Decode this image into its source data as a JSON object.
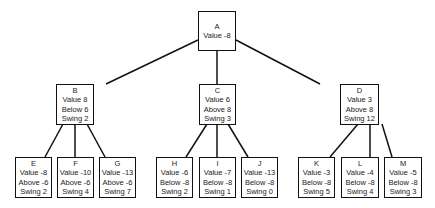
{
  "tree": {
    "root": {
      "id": "A",
      "lines": [
        "A",
        "Value -8"
      ]
    },
    "level1": [
      {
        "id": "B",
        "lines": [
          "B",
          "Value 8",
          "Below 6",
          "Swing 2"
        ]
      },
      {
        "id": "C",
        "lines": [
          "C",
          "Value 6",
          "Above 8",
          "Swing 3"
        ]
      },
      {
        "id": "D",
        "lines": [
          "D",
          "Value 3",
          "Above 8",
          "Swing 12"
        ]
      }
    ],
    "level2": [
      {
        "id": "E",
        "parent": "B",
        "lines": [
          "E",
          "Value -8",
          "Above -6",
          "Swing 2"
        ]
      },
      {
        "id": "F",
        "parent": "B",
        "lines": [
          "F",
          "Value -10",
          "Above -6",
          "Swing 4"
        ]
      },
      {
        "id": "G",
        "parent": "B",
        "lines": [
          "G",
          "Value -13",
          "Above -6",
          "Swing 7"
        ]
      },
      {
        "id": "H",
        "parent": "C",
        "lines": [
          "H",
          "Value -6",
          "Below -8",
          "Swing 2"
        ]
      },
      {
        "id": "I",
        "parent": "C",
        "lines": [
          "I",
          "Value -7",
          "Below -8",
          "Swing 1"
        ]
      },
      {
        "id": "J",
        "parent": "C",
        "lines": [
          "J",
          "Value -13",
          "Below -8",
          "Swing 0"
        ]
      },
      {
        "id": "K",
        "parent": "D",
        "lines": [
          "K",
          "Value -3",
          "Below -8",
          "Swing 5"
        ]
      },
      {
        "id": "L",
        "parent": "D",
        "lines": [
          "L",
          "Value -4",
          "Below -8",
          "Swing 4"
        ]
      },
      {
        "id": "M",
        "parent": "D",
        "lines": [
          "M",
          "Value -5",
          "Below -8",
          "Swing 3"
        ]
      }
    ]
  },
  "colors": {
    "stroke": "#111111",
    "text": "#222222",
    "background": "#ffffff"
  }
}
